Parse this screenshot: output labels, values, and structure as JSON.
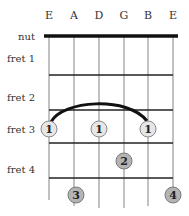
{
  "diagram": {
    "type": "guitar-chord-chart",
    "strings": [
      "E",
      "A",
      "D",
      "G",
      "B",
      "E"
    ],
    "nut_label": "nut",
    "fret_labels": [
      "fret 1",
      "fret 2",
      "fret 3",
      "fret 4"
    ],
    "barre": {
      "fret": 3,
      "from_string": 1,
      "to_string": 5,
      "finger": "1"
    },
    "fingers": [
      {
        "string": 1,
        "fret": 3,
        "label": "1",
        "style": "light"
      },
      {
        "string": 3,
        "fret": 3,
        "label": "1",
        "style": "light"
      },
      {
        "string": 5,
        "fret": 3,
        "label": "1",
        "style": "light"
      },
      {
        "string": 4,
        "fret": 4,
        "label": "2",
        "style": "dark"
      },
      {
        "string": 2,
        "fret": 5,
        "label": "3",
        "style": "dark"
      },
      {
        "string": 6,
        "fret": 5,
        "label": "4",
        "style": "dark"
      }
    ],
    "colors": {
      "light_dot": "#e6e6e6",
      "dark_dot": "#b4b4b4",
      "dot_stroke": "#8a8a8a",
      "string_line": "#a0a0a0",
      "fret_line": "#222222",
      "nut": "#111111"
    }
  }
}
